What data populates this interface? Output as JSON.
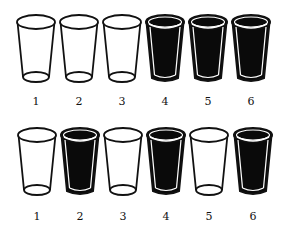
{
  "rows": [
    {
      "name": "top-row",
      "glasses": [
        {
          "label": "1",
          "filled": false
        },
        {
          "label": "2",
          "filled": false
        },
        {
          "label": "3",
          "filled": false
        },
        {
          "label": "4",
          "filled": true
        },
        {
          "label": "5",
          "filled": true
        },
        {
          "label": "6",
          "filled": true
        }
      ]
    },
    {
      "name": "bottom-row",
      "glasses": [
        {
          "label": "1",
          "filled": false
        },
        {
          "label": "2",
          "filled": true
        },
        {
          "label": "3",
          "filled": false
        },
        {
          "label": "4",
          "filled": true
        },
        {
          "label": "5",
          "filled": false
        },
        {
          "label": "6",
          "filled": true
        }
      ]
    }
  ],
  "colors": {
    "outline": "#111111",
    "fill": "#0a0a0a",
    "background": "#ffffff"
  }
}
